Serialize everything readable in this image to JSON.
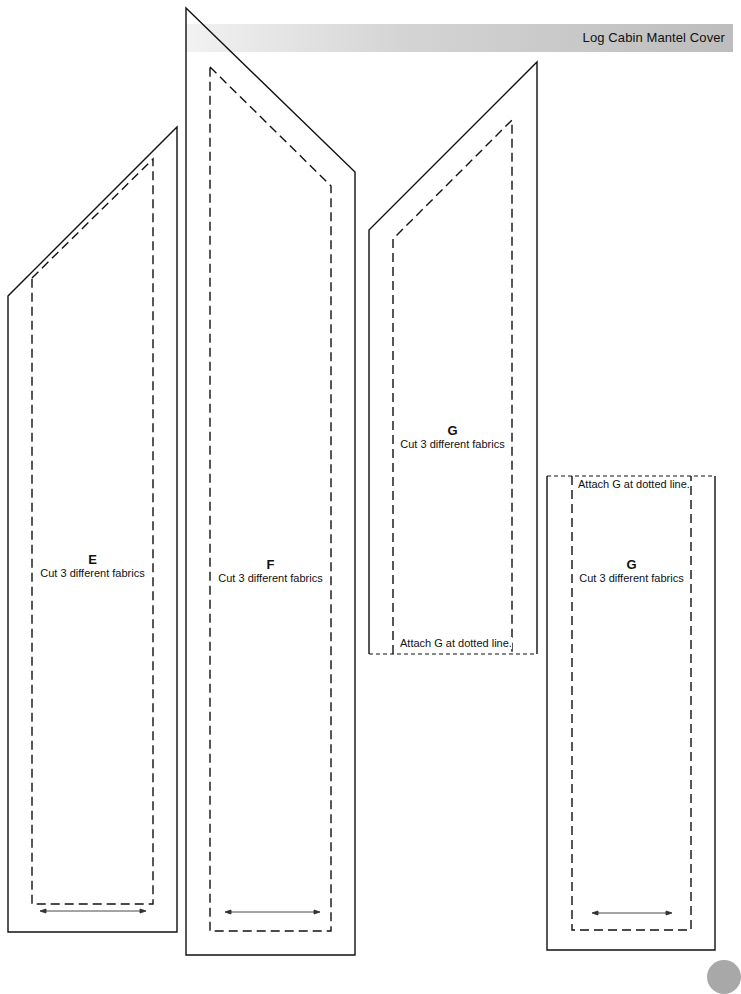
{
  "header": {
    "title": "Log Cabin Mantel Cover"
  },
  "pieces": [
    {
      "id": "E",
      "letter": "E",
      "instruction": "Cut 3 different fabrics"
    },
    {
      "id": "F",
      "letter": "F",
      "instruction": "Cut 3 different fabrics"
    },
    {
      "id": "G-top",
      "letter": "G",
      "instruction": "Cut 3 different fabrics",
      "note": "Attach G at dotted line."
    },
    {
      "id": "G-bottom",
      "letter": "G",
      "instruction": "Cut 3 different fabrics",
      "note": "Attach G at dotted line."
    }
  ],
  "colors": {
    "line": "#111111",
    "band_light": "#f2f2f2",
    "band_dark": "#bdbdbd",
    "page_marker": "#a8a8a8"
  }
}
